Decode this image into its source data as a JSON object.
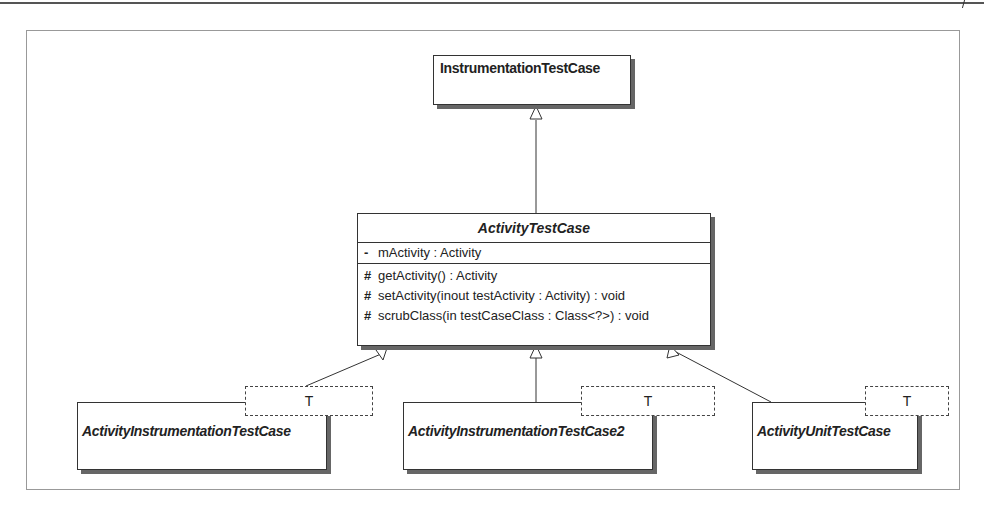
{
  "diagram": {
    "type": "UML class diagram",
    "classes": {
      "instrumentation_test_case": {
        "name": "InstrumentationTestCase"
      },
      "activity_test_case": {
        "name": "ActivityTestCase",
        "attributes": [
          {
            "visibility": "-",
            "text": "mActivity : Activity"
          }
        ],
        "operations": [
          {
            "visibility": "#",
            "text": "getActivity() : Activity"
          },
          {
            "visibility": "#",
            "text": "setActivity(inout testActivity : Activity) : void"
          },
          {
            "visibility": "#",
            "text": "scrubClass(in testCaseClass : Class<?>) : void"
          }
        ]
      },
      "activity_instrumentation_test_case": {
        "name": "ActivityInstrumentationTestCase",
        "type_param": "T"
      },
      "activity_instrumentation_test_case2": {
        "name": "ActivityInstrumentationTestCase2",
        "type_param": "T"
      },
      "activity_unit_test_case": {
        "name": "ActivityUnitTestCase",
        "type_param": "T"
      }
    },
    "relations": [
      {
        "from": "ActivityTestCase",
        "to": "InstrumentationTestCase",
        "kind": "generalization"
      },
      {
        "from": "ActivityInstrumentationTestCase",
        "to": "ActivityTestCase",
        "kind": "generalization"
      },
      {
        "from": "ActivityInstrumentationTestCase2",
        "to": "ActivityTestCase",
        "kind": "generalization"
      },
      {
        "from": "ActivityUnitTestCase",
        "to": "ActivityTestCase",
        "kind": "generalization"
      }
    ],
    "colors": {
      "line": "#333333",
      "shadow": "#666666",
      "frame": "#999999"
    }
  }
}
